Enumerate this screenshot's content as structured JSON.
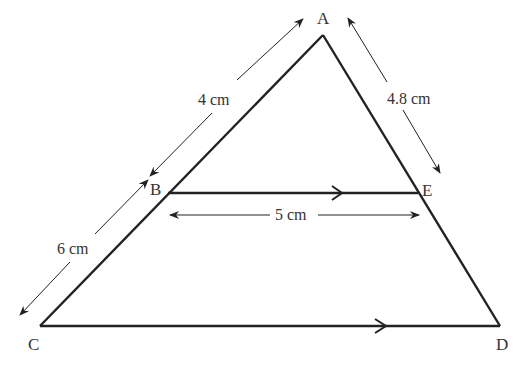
{
  "diagram": {
    "type": "similar-triangles",
    "vertices": {
      "A": {
        "label": "A",
        "x": 323,
        "y": 35
      },
      "B": {
        "label": "B",
        "x": 168,
        "y": 193
      },
      "E": {
        "label": "E",
        "x": 418,
        "y": 193
      },
      "C": {
        "label": "C",
        "x": 40,
        "y": 326
      },
      "D": {
        "label": "D",
        "x": 500,
        "y": 326
      }
    },
    "measurements": {
      "AB": "4 cm",
      "BC": "6 cm",
      "AE": "4.8 cm",
      "BE": "5 cm"
    },
    "parallel": [
      "BE",
      "CD"
    ],
    "colors": {
      "line": "#222222",
      "text": "#333333",
      "background": "#ffffff"
    }
  }
}
